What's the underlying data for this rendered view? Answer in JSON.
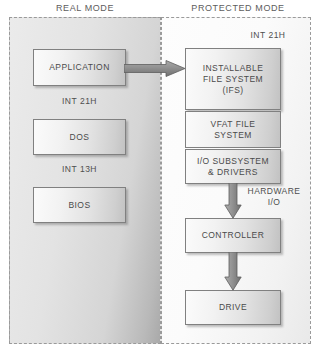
{
  "titles": {
    "real_mode": "REAL MODE",
    "protected_mode": "PROTECTED MODE"
  },
  "real_mode_panel": {
    "boxes": [
      {
        "id": "application",
        "label": "APPLICATION"
      },
      {
        "id": "dos",
        "label": "DOS"
      },
      {
        "id": "bios",
        "label": "BIOS"
      }
    ],
    "captions": [
      {
        "id": "int21h",
        "label": "INT 21H"
      },
      {
        "id": "int13h",
        "label": "INT 13H"
      }
    ]
  },
  "protected_mode_panel": {
    "entry_caption": "INT 21H",
    "boxes": [
      {
        "id": "ifs",
        "line1": "INSTALLABLE",
        "line2": "FILE SYSTEM",
        "line3": "(IFS)"
      },
      {
        "id": "vfat",
        "line1": "VFAT FILE",
        "line2": "SYSTEM"
      },
      {
        "id": "iosubsystem",
        "line1": "I/O SUBSYSTEM",
        "line2": "& DRIVERS"
      },
      {
        "id": "controller",
        "label": "CONTROLLER"
      },
      {
        "id": "drive",
        "label": "DRIVE"
      }
    ],
    "hardware_caption": {
      "line1": "HARDWARE",
      "line2": "I/O"
    }
  },
  "arrows": [
    {
      "id": "application-to-ifs",
      "direction": "right",
      "icon": "arrow-right-icon"
    },
    {
      "id": "iosubsystem-to-controller",
      "direction": "down",
      "icon": "arrow-down-icon"
    },
    {
      "id": "controller-to-drive",
      "direction": "down",
      "icon": "arrow-down-icon"
    }
  ],
  "colors": {
    "panel_border": "#9a9a9a",
    "box_border": "#808080",
    "text": "#4a4a4a",
    "arrow_fill": "#8a8a8a",
    "arrow_stroke": "#5e5e5e"
  }
}
